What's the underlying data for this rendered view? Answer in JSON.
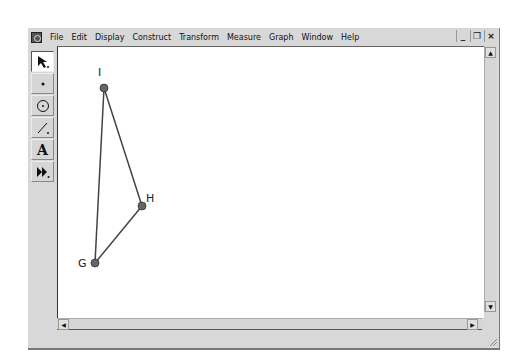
{
  "menubar": {
    "items": [
      "File",
      "Edit",
      "Display",
      "Construct",
      "Transform",
      "Measure",
      "Graph",
      "Window",
      "Help"
    ]
  },
  "window_controls": {
    "minimize": "_",
    "restore": "❐",
    "close": "×"
  },
  "toolbox": {
    "tools": [
      {
        "name": "selection-arrow-tool",
        "glyph": "➤",
        "selected": true
      },
      {
        "name": "point-tool",
        "glyph": "•",
        "selected": false
      },
      {
        "name": "compass-tool",
        "glyph": "⊙",
        "selected": false
      },
      {
        "name": "straightedge-tool",
        "glyph": "╱",
        "selected": false
      },
      {
        "name": "text-tool",
        "glyph": "A",
        "selected": false
      },
      {
        "name": "custom-tool",
        "glyph": "⏩",
        "selected": false
      }
    ]
  },
  "scrollbars": {
    "up": "▲",
    "down": "▼",
    "left": "◀",
    "right": "▶"
  },
  "sketch": {
    "points": [
      {
        "label": "I",
        "x": 104,
        "y": 88
      },
      {
        "label": "H",
        "x": 142,
        "y": 206
      },
      {
        "label": "G",
        "x": 95,
        "y": 263
      }
    ],
    "segments": [
      [
        "I",
        "H"
      ],
      [
        "H",
        "G"
      ],
      [
        "G",
        "I"
      ]
    ],
    "colors": {
      "point": "#666666",
      "segment": "#444444"
    }
  }
}
